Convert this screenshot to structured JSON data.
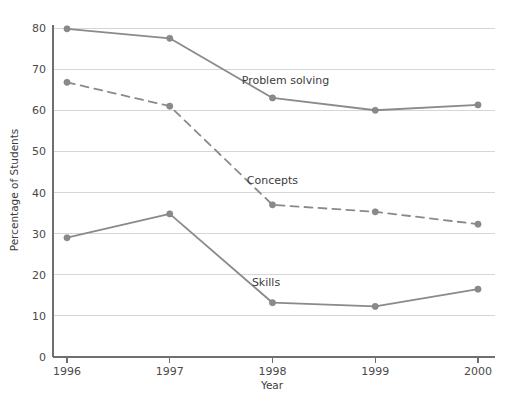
{
  "chart_data": {
    "type": "line",
    "title": "",
    "xlabel": "Year",
    "ylabel": "Percentage of Students",
    "categories": [
      "1996",
      "1997",
      "1998",
      "1999",
      "2000"
    ],
    "x": [
      1996,
      1997,
      1998,
      1999,
      2000
    ],
    "xlim": [
      1996,
      2000
    ],
    "ylim": [
      0,
      80
    ],
    "yticks": [
      0,
      10,
      20,
      30,
      40,
      50,
      60,
      70,
      80
    ],
    "xticks": [
      "1996",
      "1997",
      "1998",
      "1999",
      "2000"
    ],
    "grid": "horizontal",
    "legend_position": "inline-labels",
    "series": [
      {
        "name": "Problem solving",
        "style": "solid",
        "color": "#8a8a8a",
        "values": [
          79.8,
          77.5,
          63.0,
          60.0,
          61.3
        ],
        "label_x": 1997.7,
        "label_y": 67.3
      },
      {
        "name": "Concepts",
        "style": "dashed",
        "color": "#8a8a8a",
        "values": [
          66.8,
          61.0,
          37.0,
          35.3,
          32.3
        ],
        "label_x": 1997.75,
        "label_y": 43.0
      },
      {
        "name": "Skills",
        "style": "solid",
        "color": "#8a8a8a",
        "values": [
          29.0,
          34.8,
          13.2,
          12.3,
          16.5
        ],
        "label_x": 1997.8,
        "label_y": 18.2
      }
    ]
  },
  "colors": {
    "background": "#ffffff",
    "line": "#8a8a8a",
    "gridline": "#d6d6d6",
    "axis": "#6f6f6f",
    "text": "#3c3c3c"
  }
}
